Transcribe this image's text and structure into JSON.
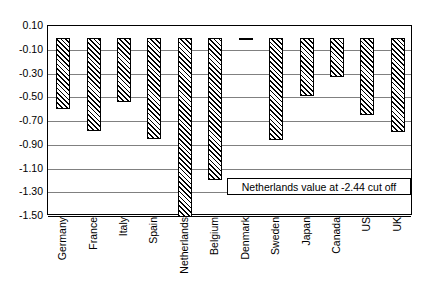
{
  "chart_data": {
    "type": "bar",
    "title": "",
    "xlabel": "",
    "ylabel": "",
    "ylim": [
      -1.5,
      0.1
    ],
    "ytick_step": 0.2,
    "grid": true,
    "legend": "none",
    "orientation": "vertical",
    "bar_fill": "diagonal-hatch",
    "categories": [
      "Germany",
      "France",
      "Italy",
      "Spain",
      "Netherlands",
      "Belgium",
      "Denmark",
      "Sweden",
      "Japan",
      "Canada",
      "US",
      "UK"
    ],
    "values": [
      -0.6,
      -0.78,
      -0.54,
      -0.85,
      -2.44,
      -1.2,
      -0.02,
      -0.86,
      -0.49,
      -0.33,
      -0.65,
      -0.79
    ],
    "ytick_labels": [
      "0.10",
      "-0.10",
      "-0.30",
      "-0.50",
      "-0.70",
      "-0.90",
      "-1.10",
      "-1.30",
      "-1.50"
    ],
    "ytick_values": [
      0.1,
      -0.1,
      -0.3,
      -0.5,
      -0.7,
      -0.9,
      -1.1,
      -1.3,
      -1.5
    ],
    "annotations": [
      {
        "text": "Netherlands value at -2.44 cut off",
        "series": "Netherlands",
        "note": "bar clipped at axis minimum"
      }
    ],
    "colors": {
      "bar_line": "#000000",
      "bar_fill": "#ffffff",
      "gridline": "#808080",
      "axis": "#000000",
      "text": "#000000"
    }
  }
}
